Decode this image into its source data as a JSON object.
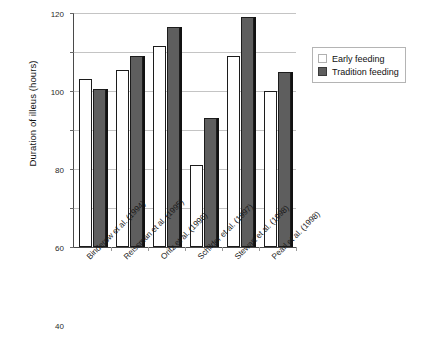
{
  "chart_data": {
    "type": "bar",
    "title": "",
    "xlabel": "",
    "ylabel": "Duration of illeus (hours)",
    "ylim": [
      0,
      120
    ],
    "yticks": [
      0,
      20,
      40,
      60,
      80,
      100,
      120
    ],
    "ytick_labels": [
      "0",
      "20",
      "40",
      "60",
      "80",
      "100",
      "120"
    ],
    "grid": true,
    "legend_position": "right",
    "categories": [
      "Binderow et al. (1994)",
      "Reissman et al. (1995)",
      "Oritz et al. (1996)",
      "Schilder et al. (1997)",
      "Stewart et al. (1998)",
      "Pearl et al. (1998)"
    ],
    "series": [
      {
        "name": "Early feeding",
        "color": "#ffffff",
        "values": [
          86,
          91,
          103,
          42,
          98,
          80
        ]
      },
      {
        "name": "Tradition feeding",
        "color": "#5e5e5e",
        "values": [
          81,
          98,
          113,
          66,
          118,
          90
        ]
      }
    ]
  },
  "legend": {
    "items": [
      {
        "label": "Early feeding",
        "swatch": "legend-swatch-early"
      },
      {
        "label": "Tradition feeding",
        "swatch": "legend-swatch-tradition"
      }
    ]
  },
  "colors": {
    "early": "#ffffff",
    "tradition": "#5e5e5e",
    "axis": "#4a4a4a",
    "grid": "#c4c4c4"
  }
}
